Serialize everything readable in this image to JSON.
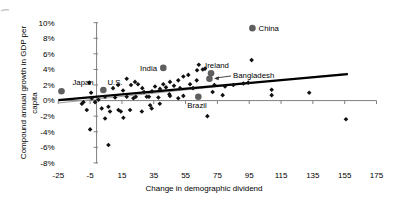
{
  "chart_data": {
    "type": "scatter",
    "title": "",
    "xlabel": "Change in demographic dividend",
    "ylabel": "Compound annual growth in GDP per capita",
    "ylabel_lines": [
      "Compound annual growth in GDP per",
      "capita"
    ],
    "xlim": [
      -25,
      175
    ],
    "ylim": [
      -8,
      10
    ],
    "x_tick_labels": [
      "-25",
      "-5",
      "15",
      "35",
      "55",
      "75",
      "95",
      "115",
      "135",
      "155",
      "175"
    ],
    "x_tick_values": [
      -25,
      -5,
      15,
      35,
      55,
      75,
      95,
      115,
      135,
      155,
      175
    ],
    "y_tick_labels": [
      "10%",
      "8%",
      "6%",
      "4%",
      "2%",
      "0%",
      "-2%",
      "-4%",
      "-6%",
      "-8%"
    ],
    "y_tick_values": [
      10,
      8,
      6,
      4,
      2,
      0,
      -2,
      -4,
      -6,
      -8
    ],
    "grid": false,
    "legend": "none",
    "colors": {
      "axis": "#808080",
      "diamond_points": "#111111",
      "highlight_points": "#5f5f5f",
      "trendline": "#000000",
      "secondary_line": "#a3a3a3",
      "label_text": "#000000",
      "crop_artifact": "#c7c7c7"
    },
    "trendline": {
      "x1": -25,
      "y1": 0.05,
      "x2": 157,
      "y2": 3.4
    },
    "secondary_line": {
      "x1": -25,
      "y1": -0.3,
      "x2": 157,
      "y2": 3.5
    },
    "highlighted_countries": [
      {
        "name": "Japan",
        "x": -23,
        "y": 1.2,
        "anchor": "middle",
        "label_dx": 21.6,
        "label_dy": -6.4,
        "callout": false
      },
      {
        "name": "U.S.",
        "x": 3.3,
        "y": 1.35,
        "anchor": "middle",
        "label_dx": 11.7,
        "label_dy": -5.0,
        "callout": false
      },
      {
        "name": "India",
        "x": 41,
        "y": 4.2,
        "anchor": "end",
        "label_dx": -6.3,
        "label_dy": 2.7,
        "callout": false
      },
      {
        "name": "Ireland",
        "x": 71,
        "y": 3.5,
        "anchor": "middle",
        "label_dx": 6.0,
        "label_dy": -5.7,
        "callout": false
      },
      {
        "name": "Bangladesh",
        "x": 70,
        "y": 2.8,
        "anchor": "start",
        "label_dx": 23.6,
        "label_dy": -1.2,
        "callout": true
      },
      {
        "name": "Brazil",
        "x": 63,
        "y": 0.5,
        "anchor": "middle",
        "label_dx": -1.3,
        "label_dy": 11.6,
        "callout": false
      },
      {
        "name": "China",
        "x": 97,
        "y": 9.3,
        "anchor": "start",
        "label_dx": 6.1,
        "label_dy": 2.9,
        "callout": false
      }
    ],
    "points": [
      [
        -10.2,
        -0.4
      ],
      [
        -9.2,
        -0.2
      ],
      [
        -7.1,
        -1.2
      ],
      [
        -5.5,
        2.3
      ],
      [
        -5.0,
        -3.7
      ],
      [
        -4.4,
        1.0
      ],
      [
        -4.0,
        0.3
      ],
      [
        -1.9,
        -0.2
      ],
      [
        0.2,
        0.1
      ],
      [
        2.3,
        -1.0
      ],
      [
        4.4,
        0.5
      ],
      [
        4.4,
        -2.3
      ],
      [
        6.5,
        -0.8
      ],
      [
        6.5,
        -5.7
      ],
      [
        7.5,
        -1.4
      ],
      [
        9.4,
        1.6
      ],
      [
        10.7,
        0.4
      ],
      [
        12.6,
        2.0
      ],
      [
        12.8,
        -1.2
      ],
      [
        14.3,
        -1.4
      ],
      [
        15.7,
        1.3
      ],
      [
        15.9,
        -2.2
      ],
      [
        18.0,
        2.8
      ],
      [
        18.0,
        0.5
      ],
      [
        20.1,
        -1.2
      ],
      [
        20.7,
        2.0
      ],
      [
        22.2,
        0.3
      ],
      [
        23.2,
        2.4
      ],
      [
        23.7,
        0.5
      ],
      [
        25.1,
        2.1
      ],
      [
        27.5,
        -1.4
      ],
      [
        27.8,
        1.6
      ],
      [
        28.9,
        1.1
      ],
      [
        30.6,
        0.5
      ],
      [
        32.0,
        0.5
      ],
      [
        32.7,
        -0.6
      ],
      [
        33.7,
        -1.0
      ],
      [
        33.9,
        1.2
      ],
      [
        35.8,
        1.8
      ],
      [
        37.9,
        0.4
      ],
      [
        38.8,
        -0.4
      ],
      [
        38.9,
        1.5
      ],
      [
        41.0,
        2.1
      ],
      [
        42.7,
        1.7
      ],
      [
        44.8,
        0.8
      ],
      [
        45.2,
        2.4
      ],
      [
        45.2,
        0.6
      ],
      [
        47.7,
        1.9
      ],
      [
        50.4,
        2.6
      ],
      [
        50.4,
        0.3
      ],
      [
        51.5,
        1.6
      ],
      [
        53.6,
        3.1
      ],
      [
        53.6,
        0.6
      ],
      [
        56.7,
        3.3
      ],
      [
        57.8,
        2.1
      ],
      [
        59.7,
        1.6
      ],
      [
        62.0,
        2.6
      ],
      [
        62.2,
        3.9
      ],
      [
        63.3,
        4.6
      ],
      [
        65.8,
        4.0
      ],
      [
        67.2,
        4.1
      ],
      [
        68.7,
        -2.0
      ],
      [
        72.0,
        1.1
      ],
      [
        73.1,
        2.0
      ],
      [
        78.3,
        0.7
      ],
      [
        79.8,
        1.8
      ],
      [
        85.0,
        2.0
      ],
      [
        91.3,
        2.2
      ],
      [
        94.4,
        2.3
      ],
      [
        96.5,
        5.2
      ],
      [
        109.1,
        1.4
      ],
      [
        109.1,
        0.7
      ],
      [
        132.7,
        1.0
      ],
      [
        155.8,
        -2.4
      ]
    ]
  }
}
